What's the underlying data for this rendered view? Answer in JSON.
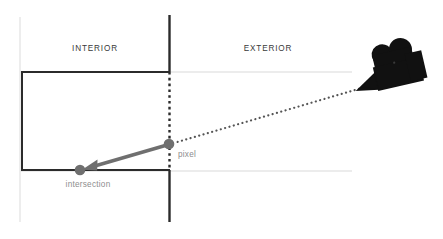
{
  "diagram": {
    "canvas": {
      "width": 443,
      "height": 239,
      "background": "#ffffff"
    },
    "zones": {
      "interior": {
        "label": "INTERIOR",
        "x": 95,
        "y": 51
      },
      "exterior": {
        "label": "EXTERIOR",
        "x": 268,
        "y": 51
      }
    },
    "points": {
      "pixel": {
        "label": "pixel",
        "x": 169,
        "y": 144,
        "radius": 5.2,
        "color": "#6f6f6f",
        "label_x": 178,
        "label_y": 157
      },
      "intersection": {
        "label": "intersection",
        "x": 80,
        "y": 170,
        "radius": 5.2,
        "color": "#6f6f6f",
        "label_x": 59,
        "label_y": 186
      }
    },
    "camera": {
      "name": "movie-camera",
      "color": "#111111",
      "body_x": 392,
      "body_y": 62,
      "lens_tip_x": 370,
      "lens_tip_y": 86,
      "rotation_deg": -12
    },
    "lines": {
      "wall": {
        "name": "vertical-wall",
        "x": 169,
        "top_y": 15,
        "bottom_y": 222,
        "solid_color": "#2b2b2b",
        "dashed_color": "#2b2b2b",
        "dash_start_y": 72,
        "dash_end_y": 170,
        "stroke_width": 2.2
      },
      "interior_rect": {
        "name": "interior-boundary",
        "left_x": 22,
        "top_y": 72,
        "bottom_y": 170,
        "right_x": 169,
        "color": "#2b2b2b",
        "stroke_width": 2.0
      },
      "guide_vertical": {
        "name": "guide-line-vertical",
        "x": 20,
        "top_y": 17,
        "bottom_y": 222,
        "color": "#e6e6e6",
        "stroke_width": 1.4
      },
      "guide_horizontal_top": {
        "name": "guide-line-top",
        "y": 72,
        "left_x": 20,
        "right_x": 352,
        "color": "#e6e6e6",
        "stroke_width": 1.4
      },
      "guide_horizontal_bottom": {
        "name": "guide-line-bottom",
        "y": 171,
        "left_x": 20,
        "right_x": 352,
        "color": "#e6e6e6",
        "stroke_width": 1.4
      }
    },
    "rays": {
      "camera_ray": {
        "name": "camera-to-pixel-ray",
        "from_x": 372,
        "from_y": 85,
        "to_x": 173,
        "to_y": 143,
        "color": "#555555",
        "style": "dotted",
        "stroke_width": 2.1,
        "dash_pattern": "0.1 4.3"
      },
      "intersection_arrow": {
        "name": "pixel-to-intersection-arrow",
        "from_x": 167,
        "from_y": 145,
        "to_x": 88,
        "to_y": 168,
        "color": "#6f6f6f",
        "stroke_width": 3.4,
        "arrowhead": true
      }
    }
  }
}
